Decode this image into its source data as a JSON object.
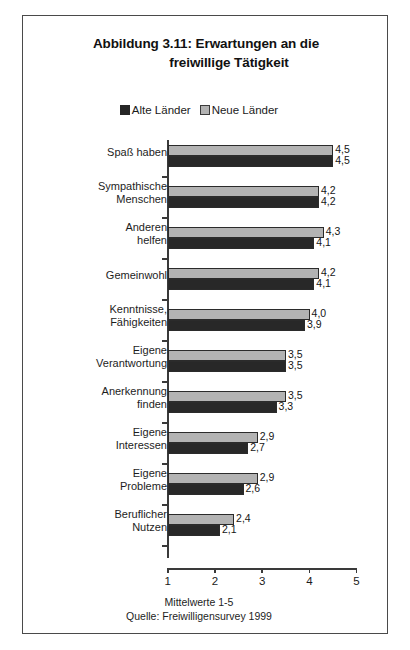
{
  "figure": {
    "title_line1": "Abbildung 3.11: Erwartungen an die",
    "title_line2": "freiwillige Tätigkeit",
    "caption_line1": "Mittelwerte 1-5",
    "caption_line2": "Quelle: Freiwilligensurvey 1999"
  },
  "legend": {
    "items": [
      {
        "label": "Alte Länder",
        "color": "#282828",
        "swatch": "filled-square"
      },
      {
        "label": "Neue Länder",
        "color": "#b3b3b3",
        "swatch": "outlined-square"
      }
    ]
  },
  "chart_data": {
    "type": "bar",
    "orientation": "horizontal",
    "title": "Abbildung 3.11: Erwartungen an die freiwillige Tätigkeit",
    "xlabel": "Mittelwerte 1-5",
    "ylabel": "",
    "xlim": [
      1,
      5
    ],
    "xticks": [
      "1",
      "2",
      "3",
      "4",
      "5"
    ],
    "grid": false,
    "legend_position": "top-center",
    "source": "Quelle: Freiwilligensurvey 1999",
    "categories": [
      "Spaß haben",
      "Sympathische Menschen",
      "Anderen helfen",
      "Gemeinwohl",
      "Kenntnisse, Fähigkeiten",
      "Eigene Verantwortung",
      "Anerkennung finden",
      "Eigene Interessen",
      "Eigene Probleme",
      "Beruflicher Nutzen"
    ],
    "category_lines": [
      [
        "Spaß haben"
      ],
      [
        "Sympathische",
        "Menschen"
      ],
      [
        "Anderen",
        "helfen"
      ],
      [
        "Gemeinwohl"
      ],
      [
        "Kenntnisse,",
        "Fähigkeiten"
      ],
      [
        "Eigene",
        "Verantwortung"
      ],
      [
        "Anerkennung",
        "finden"
      ],
      [
        "Eigene",
        "Interessen"
      ],
      [
        "Eigene",
        "Probleme"
      ],
      [
        "Beruflicher",
        "Nutzen"
      ]
    ],
    "series": [
      {
        "name": "Neue Länder",
        "color": "#b3b3b3",
        "values": [
          4.5,
          4.2,
          4.3,
          4.2,
          4.0,
          3.5,
          3.5,
          2.9,
          2.9,
          2.4
        ],
        "labels": [
          "4,5",
          "4,2",
          "4,3",
          "4,2",
          "4,0",
          "3,5",
          "3,5",
          "2,9",
          "2,9",
          "2,4"
        ]
      },
      {
        "name": "Alte Länder",
        "color": "#282828",
        "values": [
          4.5,
          4.2,
          4.1,
          4.1,
          3.9,
          3.5,
          3.3,
          2.7,
          2.6,
          2.1
        ],
        "labels": [
          "4,5",
          "4,2",
          "4,1",
          "4,1",
          "3,9",
          "3,5",
          "3,3",
          "2,7",
          "2,6",
          "2,1"
        ]
      }
    ]
  }
}
